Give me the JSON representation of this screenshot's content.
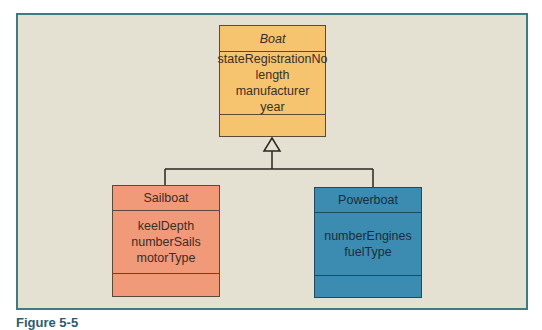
{
  "diagram": {
    "type": "uml-class-generalization",
    "superclass": {
      "name": "Boat",
      "abstract": true,
      "attributes": [
        "stateRegistrationNo",
        "length",
        "manufacturer",
        "year"
      ],
      "methods": [],
      "color": "#f6c46e"
    },
    "subclasses": [
      {
        "name": "Sailboat",
        "attributes": [
          "keelDepth",
          "numberSails",
          "motorType"
        ],
        "methods": [],
        "color": "#f19a7a"
      },
      {
        "name": "Powerboat",
        "attributes": [
          "numberEngines",
          "fuelType"
        ],
        "methods": [],
        "color": "#3b8cb0"
      }
    ],
    "relationship": "generalization",
    "frame_color": "#3d7b80",
    "background_color": "#e4e1d2"
  },
  "caption": {
    "text": "Figure 5-5"
  }
}
